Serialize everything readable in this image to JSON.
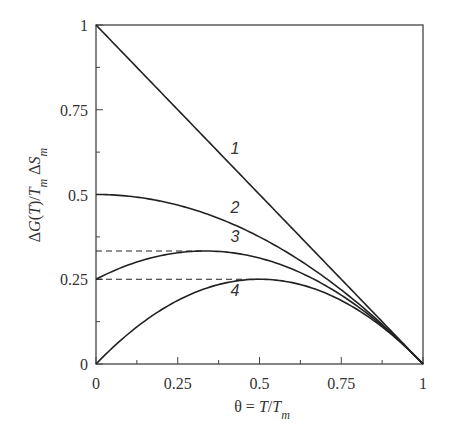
{
  "chart_data": {
    "type": "line",
    "title": "",
    "xlabel": "θ = T/T_m",
    "ylabel": "ΔG(T)/T_m ΔS_m",
    "xlim": [
      0,
      1
    ],
    "ylim": [
      0,
      1
    ],
    "grid": false,
    "legend": "none (curves labeled inline 1–4)",
    "x_ticks": [
      {
        "value": 0,
        "label": "0"
      },
      {
        "value": 0.25,
        "label": "0.25"
      },
      {
        "value": 0.5,
        "label": "0.5"
      },
      {
        "value": 0.75,
        "label": "0.75"
      },
      {
        "value": 1,
        "label": "1"
      }
    ],
    "y_ticks": [
      {
        "value": 0,
        "label": "0"
      },
      {
        "value": 0.25,
        "label": "0.25"
      },
      {
        "value": 0.5,
        "label": "0.5"
      },
      {
        "value": 0.75,
        "label": "0.75"
      },
      {
        "value": 1,
        "label": "1"
      }
    ],
    "minor_ticks": [
      0.125,
      0.375,
      0.625,
      0.875
    ],
    "x": [
      0,
      0.1,
      0.2,
      0.3,
      0.4,
      0.5,
      0.6,
      0.7,
      0.8,
      0.9,
      1.0
    ],
    "series": [
      {
        "name": "1",
        "label_pos": [
          0.425,
          0.62
        ],
        "values": [
          1.0,
          0.9,
          0.8,
          0.7,
          0.6,
          0.5,
          0.4,
          0.3,
          0.2,
          0.1,
          0.0
        ]
      },
      {
        "name": "2",
        "label_pos": [
          0.425,
          0.445
        ],
        "values": [
          0.5,
          0.495,
          0.48,
          0.455,
          0.42,
          0.375,
          0.32,
          0.255,
          0.18,
          0.095,
          0.0
        ]
      },
      {
        "name": "3",
        "label_pos": [
          0.425,
          0.36
        ],
        "values": [
          0.25,
          0.3,
          0.32,
          0.3325,
          0.33,
          0.3125,
          0.28,
          0.2325,
          0.17,
          0.0925,
          0.0
        ]
      },
      {
        "name": "4",
        "label_pos": [
          0.425,
          0.2
        ],
        "values": [
          0.0,
          0.09,
          0.16,
          0.21,
          0.24,
          0.25,
          0.24,
          0.21,
          0.16,
          0.09,
          0.0
        ]
      }
    ],
    "annotations": [
      {
        "type": "dashed-hline",
        "y": 0.3333,
        "x_from": 0,
        "x_to": 0.3333,
        "note": "maximum of curve 3"
      },
      {
        "type": "dashed-hline",
        "y": 0.25,
        "x_from": 0,
        "x_to": 0.5,
        "note": "maximum of curve 4"
      }
    ],
    "colors": {
      "line": "#222222",
      "axis": "#444444",
      "text": "#333333"
    }
  }
}
